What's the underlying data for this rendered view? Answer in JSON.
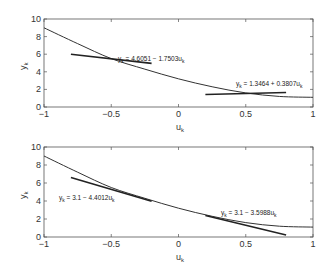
{
  "chart_data": [
    {
      "type": "line",
      "title": "",
      "xlabel": "u_k",
      "ylabel": "y_k",
      "xlim": [
        -1,
        1
      ],
      "ylim": [
        0,
        10
      ],
      "xticks": [
        "-1",
        "-0.5",
        "0",
        "0.5",
        "1"
      ],
      "yticks": [
        "0",
        "2",
        "4",
        "6",
        "8",
        "10"
      ],
      "grid": false,
      "series": [
        {
          "name": "curve",
          "x": [
            -1,
            -0.75,
            -0.5,
            -0.25,
            0,
            0.25,
            0.5,
            0.75,
            1
          ],
          "y": [
            9.0,
            7.2,
            5.5,
            4.3,
            3.2,
            2.3,
            1.6,
            1.2,
            1.1
          ]
        },
        {
          "name": "y_k = 4.6051 - 1.7503u_k",
          "x": [
            -0.8,
            -0.2
          ],
          "y": [
            6.0,
            4.96
          ]
        },
        {
          "name": "y_k = 1.3464 + 0.3807u_k",
          "x": [
            0.2,
            0.8
          ],
          "y": [
            1.42,
            1.65
          ]
        }
      ],
      "annotations": [
        {
          "text": "y_k = 4.6051 - 1.7503u_k",
          "x": -0.45,
          "y": 6.0
        },
        {
          "text": "y_k = 1.3464 + 0.3807u_k",
          "x": 0.3,
          "y": 2.1
        }
      ]
    },
    {
      "type": "line",
      "title": "",
      "xlabel": "u_k",
      "ylabel": "y_k",
      "xlim": [
        -1,
        1
      ],
      "ylim": [
        0,
        10
      ],
      "xticks": [
        "-1",
        "-0.5",
        "0",
        "0.5",
        "1"
      ],
      "yticks": [
        "0",
        "2",
        "4",
        "6",
        "8",
        "10"
      ],
      "grid": false,
      "series": [
        {
          "name": "curve",
          "x": [
            -1,
            -0.75,
            -0.5,
            -0.25,
            0,
            0.25,
            0.5,
            0.75,
            1
          ],
          "y": [
            9.0,
            7.2,
            5.5,
            4.3,
            3.2,
            2.3,
            1.6,
            1.2,
            1.1
          ]
        },
        {
          "name": "y_k = 3.1 - 4.4012u_k",
          "x": [
            -0.8,
            -0.2
          ],
          "y": [
            6.62,
            3.98
          ]
        },
        {
          "name": "y_k = 3.1 - 3.5988u_k",
          "x": [
            0.2,
            0.8
          ],
          "y": [
            2.38,
            0.22
          ]
        }
      ],
      "annotations": [
        {
          "text": "y_k = 3.1 - 4.4012u_k",
          "x": -0.78,
          "y": 4.1
        },
        {
          "text": "y_k = 3.1 - 3.5988u_k",
          "x": 0.3,
          "y": 2.6
        }
      ]
    }
  ],
  "labels": {
    "top": {
      "eq1_main": "y",
      "eq1_sub": "k",
      "eq1_rest": " = 4.6051 − 1.7503u",
      "eq1_sub2": "k",
      "eq2_main": "y",
      "eq2_sub": "k",
      "eq2_rest": " = 1.3464 + 0.3807u",
      "eq2_sub2": "k"
    },
    "bottom": {
      "eq1_main": "y",
      "eq1_sub": "k",
      "eq1_rest": " = 3.1 − 4.4012u",
      "eq1_sub2": "k",
      "eq2_main": "y",
      "eq2_sub": "k",
      "eq2_rest": " = 3.1 − 3.5988u",
      "eq2_sub2": "k"
    },
    "xlabel_main": "u",
    "xlabel_sub": "k",
    "ylabel_main": "y",
    "ylabel_sub": "k"
  }
}
